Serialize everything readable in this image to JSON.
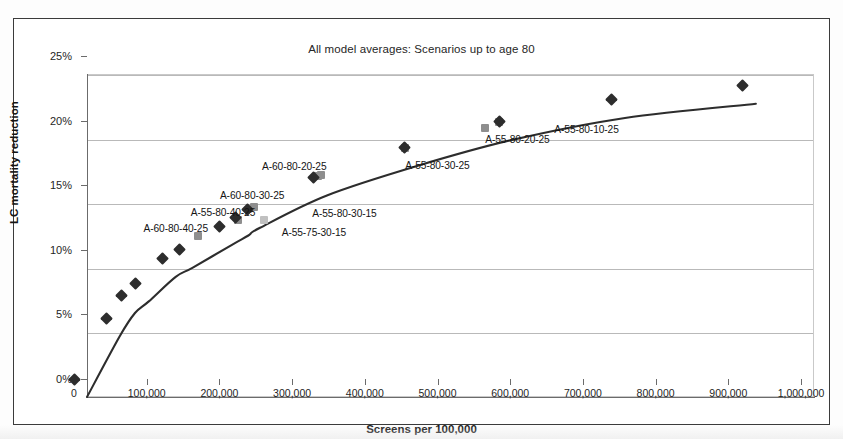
{
  "figure": {
    "title": "All model averages: Scenarios up to age 80",
    "x_axis_title": "Screens per 100,000",
    "y_axis_title": "LC mortality reduction"
  },
  "chart_data": {
    "type": "line",
    "title": "All model averages: Scenarios up to age 80",
    "xlabel": "Screens per 100,000",
    "ylabel": "LC mortality reduction",
    "xlim": [
      0,
      1000000
    ],
    "ylim": [
      0,
      0.25
    ],
    "grid": true,
    "legend": "none",
    "xticks": [
      "0",
      "100,000",
      "200,000",
      "300,000",
      "400,000",
      "500,000",
      "600,000",
      "700,000",
      "800,000",
      "900,000",
      "1,000,000"
    ],
    "xtick_values": [
      0,
      100000,
      200000,
      300000,
      400000,
      500000,
      600000,
      700000,
      800000,
      900000,
      1000000
    ],
    "yticks": [
      "0%",
      "5%",
      "10%",
      "15%",
      "20%",
      "25%"
    ],
    "ytick_values": [
      0,
      0.05,
      0.1,
      0.15,
      0.2,
      0.25
    ],
    "series": [
      {
        "name": "efficiency frontier",
        "marker": "diamond",
        "color": "#2d2d2d",
        "points": [
          {
            "x": 0,
            "y": 0.0
          },
          {
            "x": 45000,
            "y": 0.047
          },
          {
            "x": 66000,
            "y": 0.065
          },
          {
            "x": 85000,
            "y": 0.074
          },
          {
            "x": 122000,
            "y": 0.093
          },
          {
            "x": 145000,
            "y": 0.1
          },
          {
            "x": 200000,
            "y": 0.118
          },
          {
            "x": 222000,
            "y": 0.125
          },
          {
            "x": 238000,
            "y": 0.131
          },
          {
            "x": 330000,
            "y": 0.156
          },
          {
            "x": 455000,
            "y": 0.179
          },
          {
            "x": 585000,
            "y": 0.199
          },
          {
            "x": 740000,
            "y": 0.216
          },
          {
            "x": 920000,
            "y": 0.227
          }
        ]
      },
      {
        "name": "labelled scenarios",
        "marker": "square",
        "color": "#8e8e8e",
        "points": [
          {
            "x": 170000,
            "y": 0.111,
            "label": "A-60-80-40-25"
          },
          {
            "x": 225000,
            "y": 0.123,
            "label": "A-55-80-40-25"
          },
          {
            "x": 248000,
            "y": 0.133,
            "label": "A-60-80-30-25"
          },
          {
            "x": 335000,
            "y": 0.157,
            "label": "A-60-80-20-25"
          },
          {
            "x": 262000,
            "y": 0.123,
            "label": "A-55-75-30-15"
          },
          {
            "x": 340000,
            "y": 0.158,
            "label": "A-55-80-30-15"
          },
          {
            "x": 455000,
            "y": 0.179,
            "label": "A-55-80-30-25"
          },
          {
            "x": 565000,
            "y": 0.194,
            "label": "A-55-80-20-25"
          },
          {
            "x": 585000,
            "y": 0.199,
            "label": "A-55-80-10-25"
          }
        ]
      }
    ],
    "annotations": [
      {
        "text": "A-60-80-40-25",
        "x": 140000,
        "y": 0.1165
      },
      {
        "text": "A-55-80-40-25",
        "x": 205000,
        "y": 0.1295
      },
      {
        "text": "A-60-80-30-25",
        "x": 245000,
        "y": 0.1425
      },
      {
        "text": "A-60-80-20-25",
        "x": 303000,
        "y": 0.1645
      },
      {
        "text": "A-55-75-30-15",
        "x": 330000,
        "y": 0.1135
      },
      {
        "text": "A-55-80-30-15",
        "x": 372000,
        "y": 0.1285
      },
      {
        "text": "A-55-80-30-25",
        "x": 500000,
        "y": 0.1655
      },
      {
        "text": "A-55-80-20-25",
        "x": 610000,
        "y": 0.1855
      },
      {
        "text": "A-55-80-10-25",
        "x": 705000,
        "y": 0.1935
      }
    ]
  }
}
